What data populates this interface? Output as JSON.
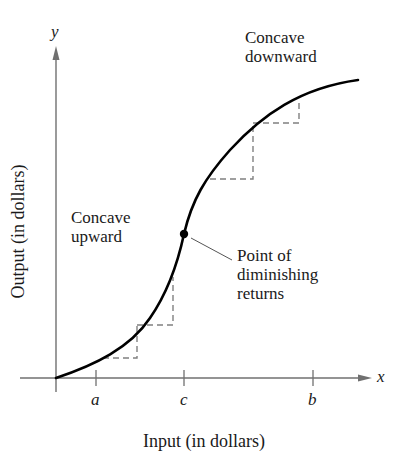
{
  "diagram": {
    "type": "graph",
    "axes": {
      "y_label": "y",
      "x_label": "x",
      "y_axis_title": "Output (in dollars)",
      "x_axis_title": "Input (in dollars)"
    },
    "ticks": [
      {
        "label": "a"
      },
      {
        "label": "c"
      },
      {
        "label": "b"
      }
    ],
    "annotations": {
      "concave_down_line1": "Concave",
      "concave_down_line2": "downward",
      "concave_up_line1": "Concave",
      "concave_up_line2": "upward",
      "point_line1": "Point of",
      "point_line2": "diminishing",
      "point_line3": "returns"
    },
    "colors": {
      "axis": "#707070",
      "curve": "#000000",
      "dashed": "#808080",
      "text": "#1a1a1a"
    }
  }
}
